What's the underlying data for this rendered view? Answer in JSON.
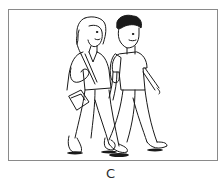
{
  "illustration": {
    "subject": "two-teenagers-walking",
    "figures": [
      "girl-with-shoulder-bag",
      "boy-with-backpack"
    ],
    "border_color": "#8a8a8a",
    "line_color": "#1a1a1a"
  },
  "caption": {
    "label": "C"
  }
}
